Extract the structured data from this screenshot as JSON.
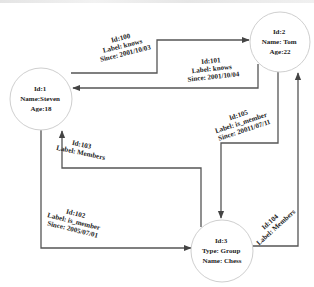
{
  "nodes": [
    {
      "id": "1",
      "lines": [
        "Id:1",
        "Name:Steven",
        "Age:18"
      ],
      "cx": 41,
      "cy": 99,
      "r": 31
    },
    {
      "id": "2",
      "lines": [
        "Id:2",
        "Name: Tom",
        "Age:22"
      ],
      "cx": 280,
      "cy": 42,
      "r": 30
    },
    {
      "id": "3",
      "lines": [
        "Id:3",
        "Type: Group",
        "Name: Chess"
      ],
      "cx": 222,
      "cy": 251,
      "r": 31
    }
  ],
  "edges": [
    {
      "id": "100",
      "from": "1",
      "to": "2",
      "lines": [
        "Id:100",
        "Label: knows",
        "Since: 2001/10/03"
      ]
    },
    {
      "id": "101",
      "from": "2",
      "to": "1",
      "lines": [
        "Id:101",
        "Label: knows",
        "Since: 2001/10/04"
      ]
    },
    {
      "id": "102",
      "from": "1",
      "to": "3",
      "lines": [
        "Id:102",
        "Label: is_member",
        "Since: 2005/07/01"
      ]
    },
    {
      "id": "103",
      "from": "3",
      "to": "1",
      "lines": [
        "Id:103",
        "Label: Members"
      ]
    },
    {
      "id": "104",
      "from": "3",
      "to": "2",
      "lines": [
        "Id:104",
        "Label: Members"
      ]
    },
    {
      "id": "105",
      "from": "2",
      "to": "3",
      "lines": [
        "Id:105",
        "Label: is_member",
        "Since: 20011/07/11"
      ]
    }
  ],
  "colors": {
    "edge": "#555555",
    "node_border": "#cfcfcf",
    "text": "#222222",
    "background": "#ffffff"
  }
}
